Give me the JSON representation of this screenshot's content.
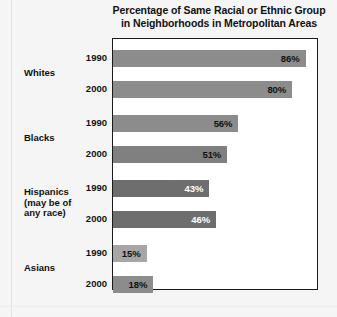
{
  "chart_data": {
    "type": "bar",
    "title_lines": [
      "Percentage of Same Racial or Ethnic Group",
      "in Neighborhoods in Metropolitan Areas"
    ],
    "xlabel": "",
    "ylabel": "",
    "xlim": [
      0,
      92
    ],
    "grid": false,
    "legend": "none",
    "orientation": "horizontal",
    "categories": [
      "Whites",
      "Blacks",
      "Hispanics (may be of any race)",
      "Asians"
    ],
    "series": [
      {
        "name": "1990",
        "values": [
          86,
          56,
          43,
          15
        ]
      },
      {
        "name": "2000",
        "values": [
          80,
          51,
          46,
          18
        ]
      }
    ],
    "groups": [
      {
        "label_lines": [
          "Whites"
        ],
        "bars": [
          {
            "year": "1990",
            "value": 86,
            "value_label": "86%",
            "bar_color": "#8c8c8c",
            "text_color": "#111111"
          },
          {
            "year": "2000",
            "value": 80,
            "value_label": "80%",
            "bar_color": "#8c8c8c",
            "text_color": "#111111"
          }
        ]
      },
      {
        "label_lines": [
          "Blacks"
        ],
        "bars": [
          {
            "year": "1990",
            "value": 56,
            "value_label": "56%",
            "bar_color": "#8c8c8c",
            "text_color": "#111111"
          },
          {
            "year": "2000",
            "value": 51,
            "value_label": "51%",
            "bar_color": "#808080",
            "text_color": "#111111"
          }
        ]
      },
      {
        "label_lines": [
          "Hispanics",
          "(may be of",
          "any race)"
        ],
        "bars": [
          {
            "year": "1990",
            "value": 43,
            "value_label": "43%",
            "bar_color": "#6e6e6e",
            "text_color": "#ffffff"
          },
          {
            "year": "2000",
            "value": 46,
            "value_label": "46%",
            "bar_color": "#6e6e6e",
            "text_color": "#ffffff"
          }
        ]
      },
      {
        "label_lines": [
          "Asians"
        ],
        "bars": [
          {
            "year": "1990",
            "value": 15,
            "value_label": "15%",
            "bar_color": "#a6a6a6",
            "text_color": "#111111"
          },
          {
            "year": "2000",
            "value": 18,
            "value_label": "18%",
            "bar_color": "#8c8c8c",
            "text_color": "#111111"
          }
        ]
      }
    ]
  },
  "colors": {
    "page_background": "#f5f5f5",
    "plot_background": "#ffffff",
    "plot_border": "#1a1a1a",
    "text": "#111111"
  }
}
